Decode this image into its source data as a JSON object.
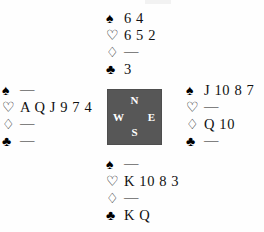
{
  "diagram": {
    "void_mark": "—",
    "suit_glyphs": {
      "spade": "♠",
      "heart": "♡",
      "diamond": "♢",
      "club": "♣"
    },
    "suit_names": [
      "spade",
      "heart",
      "diamond",
      "club"
    ],
    "compass": {
      "north": "N",
      "west": "W",
      "east": "E",
      "south": "S",
      "box_color": "#575757",
      "label_color": "#ffffff"
    },
    "hands": {
      "north": {
        "seat": "North",
        "spades": "6 4",
        "hearts": "6 5 2",
        "diamonds": "—",
        "clubs": "3"
      },
      "west": {
        "seat": "West",
        "spades": "—",
        "hearts": "A Q J 9 7 4",
        "diamonds": "—",
        "clubs": "—"
      },
      "east": {
        "seat": "East",
        "spades": "J 10 8 7",
        "hearts": "—",
        "diamonds": "Q 10",
        "clubs": "—"
      },
      "south": {
        "seat": "South",
        "spades": "—",
        "hearts": "K 10 8 3",
        "diamonds": "—",
        "clubs": "K Q"
      }
    }
  }
}
